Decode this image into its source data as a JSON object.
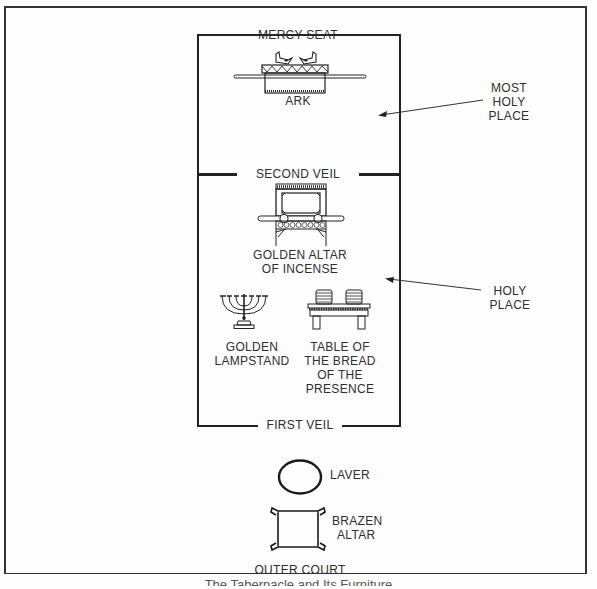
{
  "diagram": {
    "title_caption": "The Tabernacle and Its Furniture",
    "regions": {
      "most_holy_place": "MOST\nHOLY\nPLACE",
      "holy_place": "HOLY\nPLACE",
      "outer_court": "OUTER COURT"
    },
    "veils": {
      "second_veil": "SECOND VEIL",
      "first_veil": "FIRST VEIL"
    },
    "furniture": {
      "mercy_seat": "MERCY SEAT",
      "ark": "ARK",
      "golden_altar_line1": "GOLDEN ALTAR",
      "golden_altar_line2": "OF INCENSE",
      "lampstand_line1": "GOLDEN",
      "lampstand_line2": "LAMPSTAND",
      "table_line1": "TABLE OF",
      "table_line2": "THE BREAD",
      "table_line3": "OF THE",
      "table_line4": "PRESENCE",
      "laver": "LAVER",
      "brazen_altar_line1": "BRAZEN",
      "brazen_altar_line2": "ALTAR"
    },
    "labels_split": {
      "most_holy_1": "MOST",
      "most_holy_2": "HOLY",
      "most_holy_3": "PLACE",
      "holy_1": "HOLY",
      "holy_2": "PLACE"
    },
    "colors": {
      "line": "#222222",
      "background": "#fdfdfd",
      "text": "#2e2e2e"
    }
  }
}
